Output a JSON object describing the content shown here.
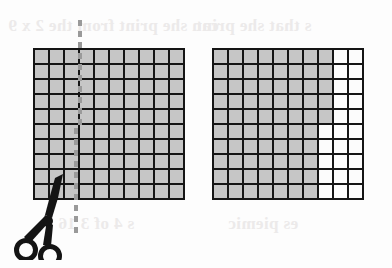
{
  "page": {
    "background_color": "#fdfdfd"
  },
  "ghost_text": {
    "note": "Faint mirrored show-through text bleeding from the reverse side of the scanned worksheet page.",
    "top_left": "can she print  from the 2 x 9",
    "top_right": "s that she print",
    "bottom_left": "s 4 of 3 16",
    "bottom_right": "es piemic"
  },
  "colors": {
    "grid_line": "#151515",
    "shaded_cell": "#c6c6c6",
    "unshaded_cell": "#fcfcfc",
    "cut_line": "#9a9a9a",
    "scissors": "#141414",
    "ghost_text": "#eceaea"
  },
  "figures": [
    {
      "id": "grid-left",
      "name": "left-hundred-grid",
      "rows": 10,
      "columns": 10,
      "total_cells": 100,
      "shaded_count": 100,
      "unshaded_count": 0,
      "label": "Whole hundred grid, all one hundred squares shaded",
      "cells": [
        [
          1,
          1,
          1,
          1,
          1,
          1,
          1,
          1,
          1,
          1
        ],
        [
          1,
          1,
          1,
          1,
          1,
          1,
          1,
          1,
          1,
          1
        ],
        [
          1,
          1,
          1,
          1,
          1,
          1,
          1,
          1,
          1,
          1
        ],
        [
          1,
          1,
          1,
          1,
          1,
          1,
          1,
          1,
          1,
          1
        ],
        [
          1,
          1,
          1,
          1,
          1,
          1,
          1,
          1,
          1,
          1
        ],
        [
          1,
          1,
          1,
          1,
          1,
          1,
          1,
          1,
          1,
          1
        ],
        [
          1,
          1,
          1,
          1,
          1,
          1,
          1,
          1,
          1,
          1
        ],
        [
          1,
          1,
          1,
          1,
          1,
          1,
          1,
          1,
          1,
          1
        ],
        [
          1,
          1,
          1,
          1,
          1,
          1,
          1,
          1,
          1,
          1
        ],
        [
          1,
          1,
          1,
          1,
          1,
          1,
          1,
          1,
          1,
          1
        ]
      ]
    },
    {
      "id": "grid-right",
      "name": "right-hundred-grid",
      "rows": 10,
      "columns": 10,
      "total_cells": 100,
      "shaded_count": 75,
      "unshaded_count": 25,
      "label": "Hundred grid with twenty-five squares left unshaded at the right side",
      "cells": [
        [
          1,
          1,
          1,
          1,
          1,
          1,
          1,
          1,
          0,
          0
        ],
        [
          1,
          1,
          1,
          1,
          1,
          1,
          1,
          1,
          0,
          0
        ],
        [
          1,
          1,
          1,
          1,
          1,
          1,
          1,
          1,
          0,
          0
        ],
        [
          1,
          1,
          1,
          1,
          1,
          1,
          1,
          1,
          0,
          0
        ],
        [
          1,
          1,
          1,
          1,
          1,
          1,
          1,
          1,
          0,
          0
        ],
        [
          1,
          1,
          1,
          1,
          1,
          1,
          1,
          0,
          0,
          0
        ],
        [
          1,
          1,
          1,
          1,
          1,
          1,
          1,
          0,
          0,
          0
        ],
        [
          1,
          1,
          1,
          1,
          1,
          1,
          1,
          0,
          0,
          0
        ],
        [
          1,
          1,
          1,
          1,
          1,
          1,
          1,
          0,
          0,
          0
        ],
        [
          1,
          1,
          1,
          1,
          1,
          1,
          1,
          0,
          0,
          0
        ]
      ]
    }
  ],
  "annotations": {
    "cut_line": {
      "name": "dashed-cut-line",
      "style": "dashed",
      "orientation": "vertical",
      "color": "#9a9a9a",
      "description": "Dashed vertical cut line drawn through the left grid between the third and fourth columns"
    },
    "scissors": {
      "name": "scissors-icon",
      "color": "#141414",
      "description": "Black scissors positioned at the bottom of the dashed cut line, indicating where to cut"
    }
  }
}
